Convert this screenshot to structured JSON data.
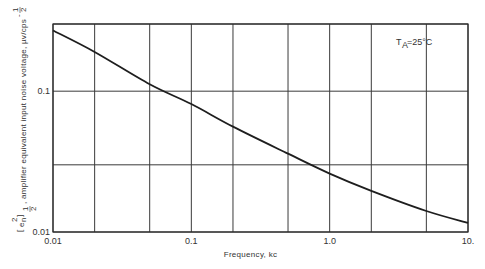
{
  "chart_data": {
    "type": "line",
    "title": "",
    "xlabel": "Frequency, kc",
    "ylabel": {
      "bracket_symbol": "e",
      "bracket_sub": "n",
      "bracket_sup": "2",
      "exponent": "1/2",
      "exponent_num": "1",
      "exponent_den": "2",
      "text": ", amplifier equivalent input noise voltage, µv/cps",
      "unit_exp_num": "1",
      "unit_exp_den": "2",
      "unit_exp_sign": "-"
    },
    "x_scale": "log",
    "y_scale": "log",
    "xlim": [
      0.01,
      10
    ],
    "ylim": [
      0.01,
      0.3
    ],
    "x_gridlines": [
      0.01,
      0.02,
      0.05,
      0.1,
      0.2,
      0.5,
      1.0,
      2,
      5,
      10
    ],
    "y_gridlines": [
      0.01,
      0.03,
      0.1,
      0.3
    ],
    "x_ticks": [
      {
        "value": 0.01,
        "label": "0.01"
      },
      {
        "value": 0.1,
        "label": "0.1"
      },
      {
        "value": 1.0,
        "label": "1.0"
      },
      {
        "value": 10,
        "label": "10."
      }
    ],
    "y_ticks": [
      {
        "value": 0.01,
        "label": "0.01"
      },
      {
        "value": 0.1,
        "label": "0.1"
      }
    ],
    "grid": true,
    "annotation": {
      "text_main": "T",
      "text_sub": "A",
      "text_rest": " =25°C",
      "position": "top-right"
    },
    "series": [
      {
        "name": "equivalent input noise voltage",
        "x": [
          0.01,
          0.02,
          0.05,
          0.1,
          0.2,
          0.5,
          1.0,
          2,
          5,
          10
        ],
        "y": [
          0.27,
          0.19,
          0.112,
          0.081,
          0.056,
          0.036,
          0.026,
          0.0196,
          0.0141,
          0.0116
        ]
      }
    ]
  }
}
